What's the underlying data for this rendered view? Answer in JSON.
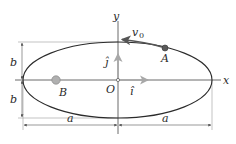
{
  "diagram": {
    "axes": {
      "x_label": "x",
      "y_label": "y",
      "origin_label": "O"
    },
    "unit_vectors": {
      "i_label": "î",
      "j_label": "ĵ"
    },
    "points": {
      "A_label": "A",
      "B_label": "B"
    },
    "velocity": {
      "symbol": "v",
      "subscript": "0"
    },
    "dimensions": {
      "semi_minor_top": "b",
      "semi_minor_bottom": "b",
      "semi_major_left": "a",
      "semi_major_right": "a"
    },
    "colors": {
      "line": "#2b2b2b",
      "guide": "#8a8a8a",
      "unit_vector": "#a8a8a8",
      "point_A": "#5a5a5a",
      "point_B": "#b0b0b0"
    }
  }
}
